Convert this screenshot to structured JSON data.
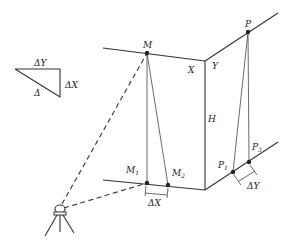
{
  "diagram": {
    "type": "survey-geometry",
    "legend_triangle": {
      "labels": {
        "top": "ΔY",
        "right": "ΔX",
        "hypotenuse": "Δ"
      }
    },
    "points": {
      "M": "M",
      "M1": "M",
      "M1_sub": "1",
      "M2": "M",
      "M2_sub": "2",
      "P": "P",
      "P1": "P",
      "P1_sub": "1",
      "P3": "P",
      "P3_sub": "3"
    },
    "axis_labels": {
      "X": "X",
      "Y": "Y",
      "H": "H"
    },
    "offsets": {
      "dx": "ΔX",
      "dy": "ΔY"
    },
    "instrument": "total-station-on-tripod",
    "colors": {
      "line": "#333333",
      "background": "#ffffff"
    }
  }
}
